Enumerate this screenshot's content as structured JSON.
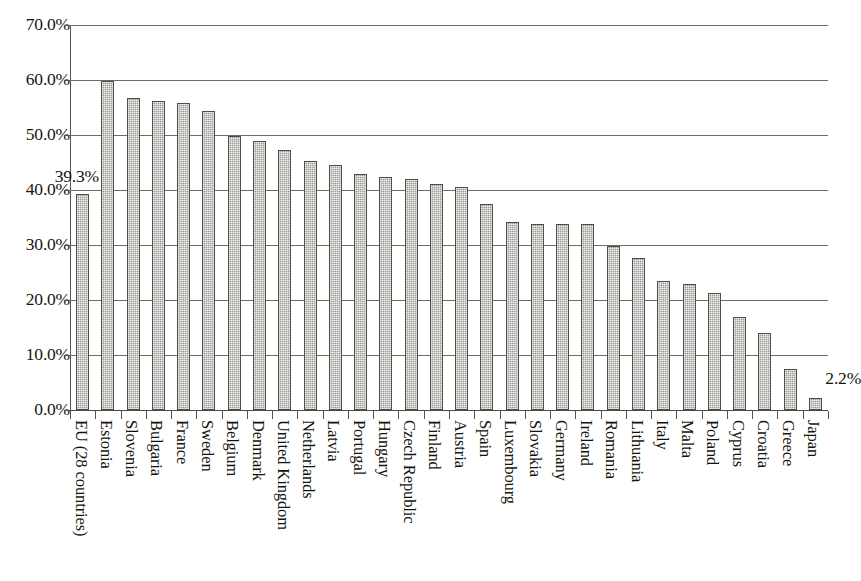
{
  "chart_data": {
    "type": "bar",
    "title": "",
    "subtitle": "",
    "xlabel": "",
    "ylabel": "",
    "ylim": [
      0,
      70
    ],
    "ytick_labels": [
      "70.0%",
      "60.0%",
      "50.0%",
      "40.0%",
      "30.0%",
      "20.0%",
      "10.0%",
      "0.0%"
    ],
    "ytick_values": [
      70,
      60,
      50,
      40,
      30,
      20,
      10,
      0
    ],
    "grid": "horizontal",
    "legend": "none",
    "categories": [
      "EU (28 countries)",
      "Estonia",
      "Slovenia",
      "Bulgaria",
      "France",
      "Sweden",
      "Belgium",
      "Denmark",
      "United Kingdom",
      "Netherlands",
      "Latvia",
      "Portugal",
      "Hungary",
      "Czech Republic",
      "Finland",
      "Austria",
      "Spain",
      "Luxembourg",
      "Slovakia",
      "Germany",
      "Ireland",
      "Romania",
      "Lithuania",
      "Italy",
      "Malta",
      "Poland",
      "Cyprus",
      "Croatia",
      "Greece",
      "Japan"
    ],
    "values": [
      39.3,
      59.9,
      56.7,
      56.1,
      55.8,
      54.3,
      49.9,
      49.0,
      47.3,
      45.3,
      44.6,
      42.9,
      42.4,
      42.0,
      41.1,
      40.5,
      37.5,
      34.1,
      33.9,
      33.8,
      33.8,
      29.9,
      27.7,
      23.4,
      23.0,
      21.2,
      16.9,
      14.0,
      7.4,
      2.2
    ],
    "annotations": [
      {
        "text": "39.3%",
        "category": "EU (28 countries)",
        "value": 39.3
      },
      {
        "text": "2.2%",
        "category": "Japan",
        "value": 2.2
      }
    ],
    "bar_fill_color": "#9a9a92",
    "bar_border_color": "#4e4e48",
    "gridline_color": "#6e6e66",
    "text_color": "#14140e"
  },
  "caption": {
    "text": ""
  }
}
